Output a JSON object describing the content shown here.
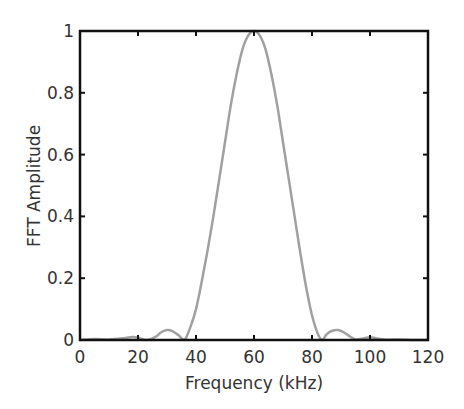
{
  "chart_data": {
    "type": "line",
    "title": "",
    "xlabel": "Frequency (kHz)",
    "ylabel": "FFT Amplitude",
    "xlim": [
      0,
      120
    ],
    "ylim": [
      0,
      1
    ],
    "xticks": [
      0,
      20,
      40,
      60,
      80,
      100,
      120
    ],
    "yticks": [
      0,
      0.2,
      0.4,
      0.6,
      0.8,
      1
    ],
    "xtick_labels": [
      "0",
      "20",
      "40",
      "60",
      "80",
      "100",
      "120"
    ],
    "ytick_labels": [
      "0",
      "0.2",
      "0.4",
      "0.6",
      "0.8",
      "1"
    ],
    "grid": false,
    "legend": null,
    "line_color": "#a0a0a0",
    "series": [
      {
        "name": "FFT Amplitude",
        "x": [
          0,
          5,
          10,
          15,
          18,
          20,
          23,
          26,
          28,
          30,
          32,
          34,
          36,
          38,
          40,
          42,
          44,
          46,
          48,
          50,
          52,
          54,
          56,
          58,
          60,
          62,
          64,
          66,
          68,
          70,
          72,
          74,
          76,
          78,
          80,
          82,
          83.5,
          85,
          87,
          89,
          91,
          93,
          95,
          98,
          100,
          103,
          106,
          110,
          115,
          120
        ],
        "y": [
          0.0,
          0.003,
          0.002,
          0.006,
          0.01,
          0.008,
          0.0,
          0.01,
          0.025,
          0.032,
          0.028,
          0.015,
          0.0,
          0.04,
          0.1,
          0.19,
          0.29,
          0.4,
          0.52,
          0.64,
          0.76,
          0.86,
          0.94,
          0.985,
          1.0,
          0.985,
          0.94,
          0.86,
          0.76,
          0.64,
          0.52,
          0.4,
          0.28,
          0.17,
          0.08,
          0.02,
          0.0,
          0.018,
          0.03,
          0.032,
          0.025,
          0.012,
          0.002,
          0.006,
          0.009,
          0.004,
          0.001,
          0.002,
          0.0,
          0.0
        ]
      }
    ]
  }
}
